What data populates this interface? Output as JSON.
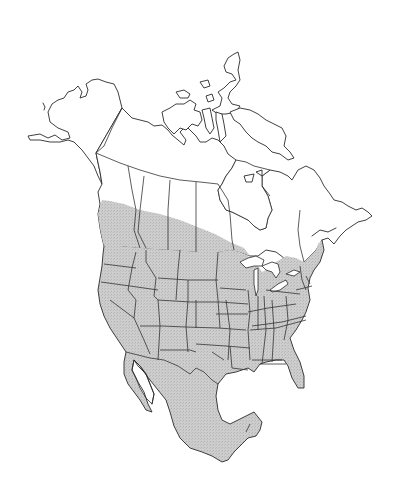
{
  "map": {
    "type": "species-range-map",
    "region": "North America",
    "countries_shown": [
      "Canada",
      "United States",
      "Mexico"
    ],
    "range_fill_color": "#c8c8c8",
    "land_fill_color": "#ffffff",
    "outline_color": "#2a2a2a",
    "background_color": "#ffffff",
    "range_description": "Shaded range covers southern British Columbia, southern Alberta, Saskatchewan and Manitoba, all of the contiguous United States, Maine/New England, and all of mainland Mexico",
    "legend": null,
    "labels": []
  }
}
